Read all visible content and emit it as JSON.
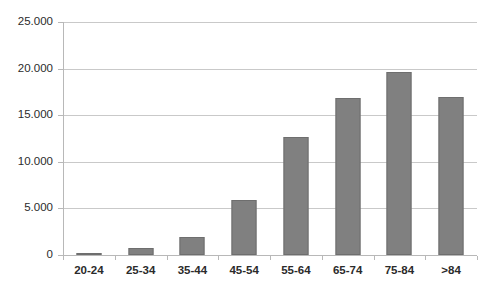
{
  "chart_data": {
    "type": "bar",
    "title": "",
    "subtitle": "",
    "xlabel": "",
    "ylabel": "",
    "categories": [
      "20-24",
      "25-34",
      "35-44",
      "45-54",
      "55-64",
      "65-74",
      "75-84",
      ">84"
    ],
    "values": [
      150,
      700,
      1950,
      5900,
      12700,
      16900,
      19600,
      17000
    ],
    "ylim": [
      0,
      25000
    ],
    "y_ticks": [
      0,
      5000,
      10000,
      15000,
      20000,
      25000
    ],
    "y_tick_labels": [
      "0",
      "5.000",
      "10.000",
      "15.000",
      "20.000",
      "25.000"
    ],
    "grid": true,
    "legend": false,
    "legend_position": "none",
    "series": [
      {
        "name": "",
        "values": [
          150,
          700,
          1950,
          5900,
          12700,
          16900,
          19600,
          17000
        ]
      }
    ],
    "colors": {
      "bar_fill": "#808080",
      "bar_border": "#6e6e6e",
      "gridline": "#c9c9c9",
      "axis_line": "#b8b8b8",
      "tick_label": "#2b2b2b",
      "background": "#ffffff"
    }
  },
  "axis": {
    "y_labels": [
      "25.000",
      "20.000",
      "15.000",
      "10.000",
      "5.000",
      "0"
    ],
    "x_labels": [
      "20-24",
      "25-34",
      "35-44",
      "45-54",
      "55-64",
      "65-74",
      "75-84",
      ">84"
    ]
  }
}
